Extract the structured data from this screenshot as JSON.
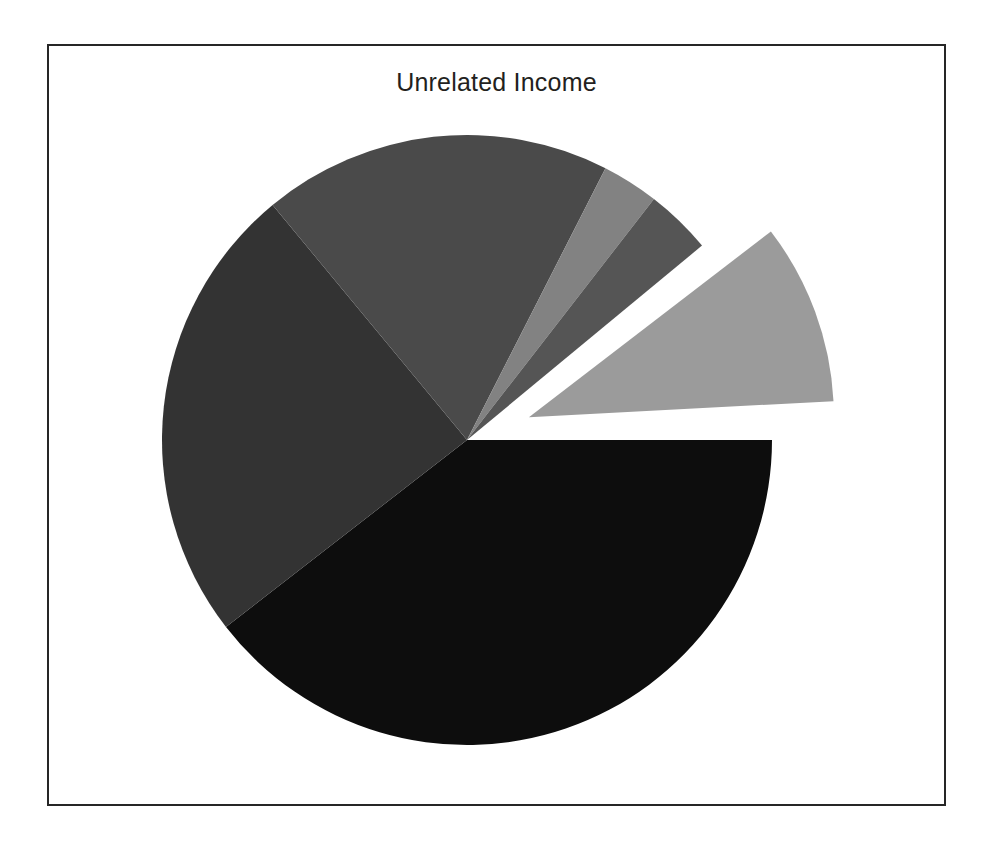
{
  "figure": {
    "title": "Unrelated Income",
    "background": "#ffffff",
    "border_color": "#262626"
  },
  "chart_data": {
    "type": "pie",
    "title": "Unrelated Income",
    "xlabel": "",
    "ylabel": "",
    "legend": "none",
    "grid": false,
    "start_angle_deg": 0,
    "direction": "clockwise",
    "center_px": [
      467,
      440
    ],
    "radius_px": 305,
    "categories": [
      "Segment 1",
      "Segment 2",
      "Segment 3",
      "Segment 4",
      "Segment 5",
      "Segment 6"
    ],
    "values": [
      39.5,
      24.5,
      18.5,
      3.0,
      3.5,
      11.0
    ],
    "colors": [
      "#0d0d0d",
      "#333333",
      "#4a4a4a",
      "#828282",
      "#555555",
      "#9b9b9b"
    ],
    "exploded": [
      false,
      false,
      false,
      false,
      false,
      true
    ],
    "explode_offset_px": 66,
    "slices": [
      {
        "label": "Segment 1",
        "value": 39.5,
        "color": "#0d0d0d",
        "start_deg": 0.0,
        "end_deg": 142.2,
        "exploded": false
      },
      {
        "label": "Segment 2",
        "value": 24.5,
        "color": "#333333",
        "start_deg": 142.2,
        "end_deg": 230.4,
        "exploded": false
      },
      {
        "label": "Segment 3",
        "value": 18.5,
        "color": "#4a4a4a",
        "start_deg": 230.4,
        "end_deg": 297.0,
        "exploded": false
      },
      {
        "label": "Segment 4",
        "value": 3.0,
        "color": "#828282",
        "start_deg": 297.0,
        "end_deg": 307.8,
        "exploded": false
      },
      {
        "label": "Segment 5",
        "value": 3.5,
        "color": "#555555",
        "start_deg": 307.8,
        "end_deg": 320.4,
        "exploded": false
      },
      {
        "label": "Segment 6",
        "value": 11.0,
        "color": "#9b9b9b",
        "start_deg": 322.5,
        "end_deg": 357.0,
        "exploded": true
      }
    ]
  }
}
